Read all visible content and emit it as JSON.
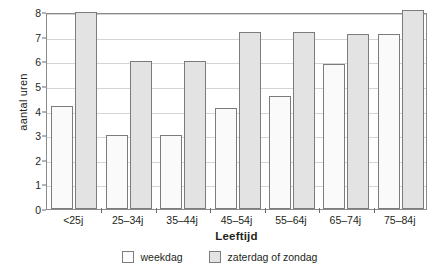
{
  "chart_data": {
    "type": "bar",
    "title": "",
    "xlabel": "Leeftijd",
    "ylabel": "aantal uren",
    "ylim": [
      0,
      8
    ],
    "yticks": [
      0,
      1,
      2,
      3,
      4,
      5,
      6,
      7,
      8
    ],
    "grid": true,
    "legend_position": "bottom",
    "categories": [
      "<25j",
      "25–34j",
      "35–44j",
      "45–54j",
      "55–64j",
      "65–74j",
      "75–84j"
    ],
    "series": [
      {
        "name": "weekdag",
        "color": "#fafafa",
        "values": [
          4.2,
          3.0,
          3.0,
          4.1,
          4.6,
          5.9,
          7.1
        ]
      },
      {
        "name": "zaterdag of zondag",
        "color": "#e3e3e3",
        "values": [
          8.0,
          6.0,
          6.0,
          7.2,
          7.2,
          7.1,
          8.1
        ]
      }
    ]
  },
  "axes": {
    "y_title": "aantal uren",
    "x_title": "Leeftijd"
  },
  "legend": {
    "items": [
      {
        "label": "weekdag"
      },
      {
        "label": "zaterdag of zondag"
      }
    ]
  },
  "colors": {
    "weekday_fill": "#fafafa",
    "weekend_fill": "#e3e3e3",
    "bar_border": "#7c7c7c",
    "gridline": "#d4d4d4",
    "frame": "#8b8b8b",
    "text": "#231f20"
  }
}
